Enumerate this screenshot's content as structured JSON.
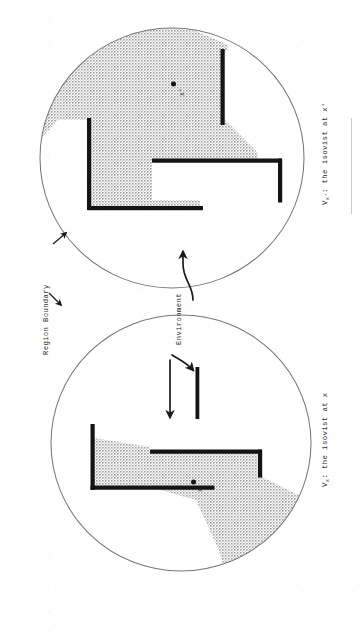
{
  "figure": {
    "kind": "scanned-diagram",
    "orientation_note": "page scanned rotated 90 degrees clockwise; all text reads bottom-to-top",
    "background_color": "#ffffff",
    "ink_color": "#1a1a1a",
    "shade_color": "#b9b9b9",
    "boundary_color": "#6b6b6b"
  },
  "labels": {
    "region_boundary": "Region Boundary",
    "environment": "Environment",
    "caption_left_prefix": "V",
    "caption_left_sub": "x",
    "caption_left_rest": ": the isovist at x",
    "caption_right_prefix": "V",
    "caption_right_sub": "x'",
    "caption_right_rest": ": the isovist at x'",
    "caption_left_full": "Vx: the isovist at x",
    "caption_right_full": "Vx': the isovist at x'"
  },
  "panels": [
    {
      "id": "left-panel",
      "name": "isovist-at-x",
      "caption": "Vx: the isovist at x",
      "viewpoint_label": "x",
      "viewpoint_marker": "filled-dot",
      "region_shape": "circle",
      "shaded_region_description": "isovist polygon visible from viewpoint x"
    },
    {
      "id": "right-panel",
      "name": "isovist-at-x-prime",
      "caption": "Vx': the isovist at x'",
      "viewpoint_label": "x'",
      "viewpoint_marker": "filled-dot",
      "region_shape": "circle",
      "shaded_region_description": "isovist polygon visible from viewpoint x prime"
    }
  ],
  "annotations": [
    {
      "id": "region-boundary-annotation",
      "text": "Region Boundary",
      "arrows": 2
    },
    {
      "id": "environment-annotation",
      "text": "Environment",
      "arrows": 2
    }
  ]
}
